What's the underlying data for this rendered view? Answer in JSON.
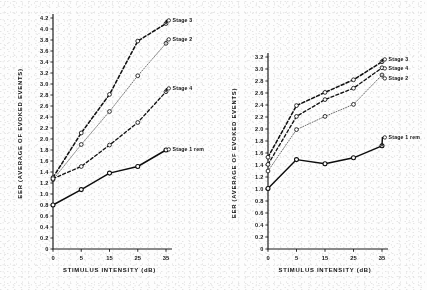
{
  "figure": {
    "name": "eer-by-stimulus-intensity",
    "background": "#fdfdfd",
    "ink": "#111111"
  },
  "chart_data": [
    {
      "type": "line",
      "id": "left",
      "title": "",
      "xlabel": "STIMULUS INTENSITY (dB)",
      "ylabel": "EER (AVERAGE OF EVOKED EVENTS)",
      "x": [
        0,
        5,
        15,
        25,
        35
      ],
      "categories": [
        "0",
        "5",
        "15",
        "25",
        "35"
      ],
      "xlim": [
        0,
        35
      ],
      "ylim": [
        0,
        4.2
      ],
      "ytick_step": 0.2,
      "yticks": [
        "4.2",
        "4.0",
        "3.8",
        "3.6",
        "3.4",
        "3.2",
        "3.0",
        "2.8",
        "2.6",
        "2.4",
        "2.2",
        "2.0",
        "1.8",
        "1.6",
        "1.4",
        "1.2",
        "1.0",
        "0.8",
        "0.6",
        "0.4",
        "0.2",
        "0"
      ],
      "grid": false,
      "legend_position": "right-inline",
      "series": [
        {
          "name": "Stage 3",
          "label": "Stage 3",
          "style": "dashed-bold",
          "color": "#111111",
          "values": [
            1.3,
            2.11,
            2.81,
            3.78,
            4.1
          ]
        },
        {
          "name": "Stage 2",
          "label": "Stage 2",
          "style": "dotted-fine",
          "color": "#555555",
          "values": [
            1.26,
            1.9,
            2.5,
            3.15,
            3.74
          ]
        },
        {
          "name": "Stage 4",
          "label": "Stage 4",
          "style": "dashed",
          "color": "#111111",
          "values": [
            1.28,
            1.5,
            1.89,
            2.3,
            2.86
          ]
        },
        {
          "name": "Stage 1 rem",
          "label": "Stage 1 rem",
          "style": "solid",
          "color": "#0d0d0d",
          "values": [
            0.8,
            1.08,
            1.38,
            1.5,
            1.8
          ]
        }
      ]
    },
    {
      "type": "line",
      "id": "right",
      "title": "",
      "xlabel": "STIMULUS INTENSITY (dB)",
      "ylabel": "EER (AVERAGE OF EVOKED EVENTS)",
      "x": [
        0,
        5,
        15,
        25,
        35
      ],
      "categories": [
        "0",
        "5",
        "15",
        "25",
        "35"
      ],
      "xlim": [
        0,
        35
      ],
      "ylim": [
        0,
        3.2
      ],
      "ytick_step": 0.2,
      "yticks": [
        "3.2",
        "3.0",
        "2.8",
        "2.6",
        "2.4",
        "2.2",
        "2.0",
        "1.8",
        "1.6",
        "1.4",
        "1.2",
        "1.0",
        "0.8",
        "0.6",
        "0.4",
        "0.2",
        "0"
      ],
      "grid": false,
      "legend_position": "right-inline",
      "series": [
        {
          "name": "Stage 3",
          "label": "Stage 3",
          "style": "dashed-bold",
          "color": "#111111",
          "values": [
            1.53,
            2.39,
            2.61,
            2.82,
            3.12
          ]
        },
        {
          "name": "Stage 4",
          "label": "Stage 4",
          "style": "dashed",
          "color": "#111111",
          "values": [
            1.41,
            2.21,
            2.49,
            2.68,
            3.02
          ]
        },
        {
          "name": "Stage 2",
          "label": "Stage 2",
          "style": "dotted-fine",
          "color": "#555555",
          "values": [
            1.3,
            1.99,
            2.21,
            2.41,
            2.9
          ]
        },
        {
          "name": "Stage 1 rem",
          "label": "Stage 1 rem",
          "style": "solid",
          "color": "#0d0d0d",
          "values": [
            1.01,
            1.49,
            1.42,
            1.52,
            1.72
          ]
        }
      ]
    }
  ]
}
